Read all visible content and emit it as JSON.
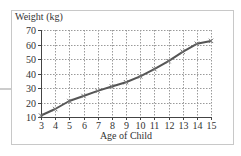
{
  "chart_data": {
    "type": "line",
    "title": "",
    "ylabel": "Weight (kg)",
    "xlabel": "Age of Child",
    "x": [
      3,
      4,
      5,
      6,
      7,
      8,
      9,
      10,
      11,
      12,
      13,
      14,
      15
    ],
    "series": [
      {
        "name": "Weight",
        "values": [
          11,
          15.5,
          21,
          24.5,
          28,
          31,
          34,
          38,
          43,
          48.5,
          55,
          60.5,
          62.5
        ],
        "color": "#555555",
        "marker": "x"
      }
    ],
    "xlim": [
      3,
      15
    ],
    "ylim": [
      10,
      70
    ],
    "yticks": [
      10,
      20,
      30,
      40,
      50,
      60,
      70
    ],
    "xticks": [
      3,
      4,
      5,
      6,
      7,
      8,
      9,
      10,
      11,
      12,
      13,
      14,
      15
    ],
    "grid": true,
    "grid_style": "dotted",
    "legend": null
  },
  "colors": {
    "frame": "#c8c8c8",
    "axis": "#444444",
    "grid": "#9a9a9a",
    "line": "#555555"
  }
}
